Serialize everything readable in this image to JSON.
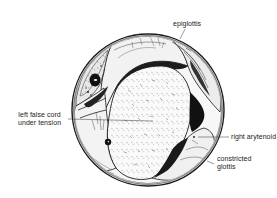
{
  "figure": {
    "type": "laryngoscopic-view-illustration",
    "view": "circular endoscopic view of larynx",
    "labels": {
      "epiglottis": "epiglottis",
      "left_false_cord": "left false cord\nunder tension",
      "right_arytenoid": "right arytenoid",
      "constricted_glottis": "constricted\nglottis"
    }
  },
  "colors": {
    "ink": "#1a1a1a",
    "background": "#ffffff",
    "tissue_light": "#f4f4f4",
    "tissue_shadow": "#2a2a2a"
  }
}
